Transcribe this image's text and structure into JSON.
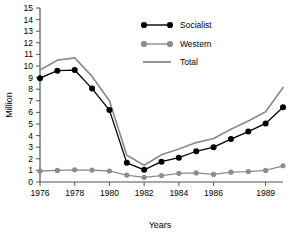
{
  "chart_data": {
    "type": "line",
    "title": "",
    "xlabel": "Years",
    "ylabel": "Million",
    "ylim": [
      0,
      15
    ],
    "xlim": [
      1976,
      1990
    ],
    "grid": false,
    "legend_position": "top-right",
    "x": [
      1976,
      1977,
      1978,
      1979,
      1980,
      1981,
      1982,
      1983,
      1984,
      1985,
      1986,
      1987,
      1988,
      1989,
      1990
    ],
    "xtick_labels": [
      "1976",
      "1978",
      "1980",
      "1982",
      "1984",
      "1986",
      "1989"
    ],
    "xtick_values": [
      1976,
      1978,
      1980,
      1982,
      1984,
      1986,
      1989
    ],
    "ytick_labels": [
      "0",
      "1",
      "2",
      "3",
      "4",
      "5",
      "6",
      "7",
      "8",
      "9",
      "10",
      "11",
      "12",
      "13",
      "14",
      "15"
    ],
    "ytick_values": [
      0,
      1,
      2,
      3,
      4,
      5,
      6,
      7,
      8,
      9,
      10,
      11,
      12,
      13,
      14,
      15
    ],
    "series": [
      {
        "name": "Socialist",
        "color": "#000000",
        "marker": "circle",
        "values": [
          8.95,
          9.6,
          9.65,
          8.05,
          6.2,
          1.65,
          1.05,
          1.75,
          2.1,
          2.65,
          3.0,
          3.7,
          4.35,
          5.05,
          6.45
        ]
      },
      {
        "name": "Western",
        "color": "#8c8c8c",
        "marker": "circle",
        "values": [
          0.95,
          1.0,
          1.05,
          1.03,
          0.95,
          0.6,
          0.4,
          0.55,
          0.75,
          0.78,
          0.65,
          0.85,
          0.9,
          1.0,
          1.4
        ]
      },
      {
        "name": "Total",
        "color": "#8c8c8c",
        "marker": "none",
        "values": [
          9.65,
          10.5,
          10.7,
          9.1,
          7.0,
          2.3,
          1.45,
          2.35,
          2.85,
          3.4,
          3.75,
          4.55,
          5.25,
          6.05,
          8.15
        ]
      }
    ]
  },
  "legend": {
    "items": [
      {
        "label": "Socialist"
      },
      {
        "label": "Western"
      },
      {
        "label": "Total"
      }
    ]
  }
}
